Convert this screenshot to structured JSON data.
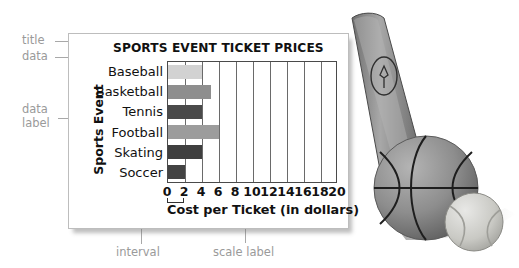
{
  "chart_data": {
    "type": "bar",
    "orientation": "horizontal",
    "title": "SPORTS EVENT  TICKET PRICES",
    "categories": [
      "Baseball",
      "Basketball",
      "Tennis",
      "Football",
      "Skating",
      "Soccer"
    ],
    "values": [
      4,
      5,
      4,
      6,
      4,
      2
    ],
    "bar_colors": [
      "#d2d2d2",
      "#8e8e8e",
      "#4a4a4a",
      "#9c9c9c",
      "#3f3f3f",
      "#434343"
    ],
    "xlabel": "Cost per Ticket (in dollars)",
    "ylabel": "Sports Event",
    "xlim": [
      0,
      20
    ],
    "xticks": [
      0,
      2,
      4,
      6,
      8,
      10,
      12,
      14,
      16,
      18,
      20
    ],
    "xtick_labels": [
      "0",
      "2",
      "4",
      "6",
      "8",
      "10",
      "12",
      "14",
      "16",
      "18",
      "20"
    ],
    "interval": 2,
    "grid": true,
    "legend": false
  },
  "annotations": {
    "title": "title",
    "data": "data",
    "data_label_line1": "data",
    "data_label_line2": "label",
    "scale": "scale",
    "interval": "interval",
    "scale_label": "scale label"
  },
  "photo": {
    "bat": "baseball-bat",
    "basketball": "basketball",
    "tennis_ball": "tennis-ball"
  },
  "colors": {
    "annotation": "#9a9a9a",
    "axis": "#4a4a4a",
    "text": "#111111",
    "card_border": "#bdbdbd"
  }
}
